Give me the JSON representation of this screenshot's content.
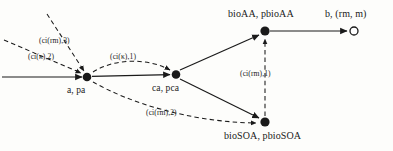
{
  "diagram": {
    "type": "directed-graph",
    "title": "",
    "colors": {
      "stroke": "#1a1a1a",
      "node_fill": "#1a1a1a",
      "terminal_fill": "#ffffff",
      "background": "#fdfdfb"
    },
    "nodes": [
      {
        "id": "a",
        "label": "a, pa",
        "x": 87,
        "y": 77,
        "style": "filled"
      },
      {
        "id": "ca",
        "label": "ca, pca",
        "x": 176,
        "y": 74,
        "style": "filled"
      },
      {
        "id": "bioAA",
        "label": "bioAA, pbioAA",
        "x": 265,
        "y": 31,
        "style": "filled"
      },
      {
        "id": "bioSOA",
        "label": "bioSOA, pbioSOA",
        "x": 265,
        "y": 122,
        "style": "filled"
      },
      {
        "id": "b",
        "label": "b, (rm, m)",
        "x": 355,
        "y": 31,
        "style": "open"
      }
    ],
    "edges": [
      {
        "from": "external-left",
        "to": "a",
        "line": "solid",
        "label": ""
      },
      {
        "from": "external-upper",
        "to": "a",
        "line": "dashed",
        "label": "(ci(rm),3)"
      },
      {
        "from": "external-left2",
        "to": "a",
        "line": "dashed",
        "label": "(ci(κ),2)"
      },
      {
        "from": "a",
        "to": "ca",
        "line": "solid",
        "label": ""
      },
      {
        "from": "a",
        "to": "ca",
        "line": "dashed",
        "label": "(ci(κ),1)"
      },
      {
        "from": "a",
        "to": "bioSOA",
        "line": "dashed",
        "label": "(ci(rm),2)"
      },
      {
        "from": "ca",
        "to": "bioAA",
        "line": "solid",
        "label": ""
      },
      {
        "from": "ca",
        "to": "bioSOA",
        "line": "solid",
        "label": ""
      },
      {
        "from": "bioSOA",
        "to": "bioAA",
        "line": "dashed",
        "label": "(ci(rm),1)"
      },
      {
        "from": "bioAA",
        "to": "b",
        "line": "solid",
        "label": ""
      }
    ],
    "labels": {
      "node_a": "a, pa",
      "node_ca": "ca, pca",
      "node_bioAA": "bioAA, pbioAA",
      "node_bioSOA": "bioSOA, pbioSOA",
      "node_b": "b, (rm, m)",
      "edge_ci_rm_3": "(ci(rm),3)",
      "edge_ci_kappa_2": "(ci(κ),2)",
      "edge_ci_kappa_1": "(ci(κ),1)",
      "edge_ci_rm_2": "(ci(rm),2)",
      "edge_ci_rm_1": "(ci(rm),1)"
    }
  }
}
